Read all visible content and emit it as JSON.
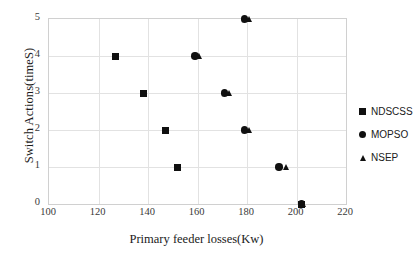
{
  "chart_data": {
    "type": "scatter",
    "title": "",
    "xlabel": "Primary feeder losses(Kw)",
    "ylabel": "Switch Actions(timeS)",
    "xlim": [
      100,
      220
    ],
    "ylim": [
      0,
      5
    ],
    "xticks": [
      100,
      120,
      140,
      160,
      180,
      200,
      220
    ],
    "yticks": [
      0,
      1,
      2,
      3,
      4,
      5
    ],
    "grid": true,
    "legend_position": "right",
    "series": [
      {
        "name": "NDSCSS",
        "marker": "square",
        "color": "#101010",
        "points": [
          {
            "x": 127,
            "y": 4
          },
          {
            "x": 138,
            "y": 3
          },
          {
            "x": 147,
            "y": 2
          },
          {
            "x": 152,
            "y": 1
          },
          {
            "x": 202,
            "y": 0
          }
        ]
      },
      {
        "name": "MOPSO",
        "marker": "circle",
        "color": "#101010",
        "points": [
          {
            "x": 179,
            "y": 5
          },
          {
            "x": 159,
            "y": 4
          },
          {
            "x": 171,
            "y": 3
          },
          {
            "x": 179,
            "y": 2
          },
          {
            "x": 193,
            "y": 1
          },
          {
            "x": 202,
            "y": 0
          }
        ]
      },
      {
        "name": "NSEP",
        "marker": "triangle",
        "color": "#101010",
        "points": [
          {
            "x": 181,
            "y": 5
          },
          {
            "x": 161,
            "y": 4
          },
          {
            "x": 173,
            "y": 3
          },
          {
            "x": 181,
            "y": 2
          },
          {
            "x": 196,
            "y": 1
          },
          {
            "x": 203,
            "y": 0
          }
        ]
      }
    ]
  }
}
